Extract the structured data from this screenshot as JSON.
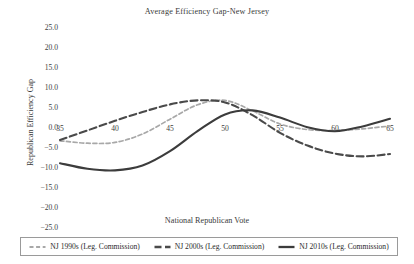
{
  "chart_data": {
    "type": "line",
    "title": "Average Efficiency Gap-New Jersey",
    "xlabel": "National Republican Vote",
    "ylabel": "Republican Efficiency Gap",
    "xlim": [
      35,
      65
    ],
    "ylim": [
      -25.0,
      25.0
    ],
    "grid": false,
    "legend_position": "bottom",
    "xticks": [
      "35",
      "40",
      "45",
      "50",
      "55",
      "60",
      "65"
    ],
    "xtick_values": [
      35,
      40,
      45,
      50,
      55,
      60,
      65
    ],
    "yticks": [
      "25.0",
      "20.0",
      "15.0",
      "10.0",
      "5.0",
      "0.0",
      "-5.0",
      "-10.0",
      "-15.0",
      "-20.0",
      "-25.0"
    ],
    "ytick_values": [
      25.0,
      20.0,
      15.0,
      10.0,
      5.0,
      0.0,
      -5.0,
      -10.0,
      -15.0,
      -20.0,
      -25.0
    ],
    "x": [
      35,
      37.5,
      40,
      42.5,
      45,
      47.5,
      50,
      52.5,
      55,
      57.5,
      60,
      62.5,
      65
    ],
    "series": [
      {
        "name": "NJ 1990s (Leg. Commission)",
        "color": "#a8a8a8",
        "dash": "4,2.6",
        "width": 1.7,
        "values": [
          -3.2,
          -3.8,
          -3.6,
          -1.5,
          2.2,
          5.8,
          6.9,
          4.3,
          1.0,
          -0.4,
          -0.6,
          -0.2,
          0.5
        ]
      },
      {
        "name": "NJ 2000s (Leg. Commission)",
        "color": "#4a4a4a",
        "dash": "7,3.5",
        "width": 2.1,
        "values": [
          -3.0,
          -0.6,
          1.8,
          4.0,
          5.9,
          6.9,
          6.4,
          3.2,
          -1.2,
          -4.4,
          -6.4,
          -7.1,
          -6.5
        ]
      },
      {
        "name": "NJ 2010s (Leg. Commission)",
        "color": "#3c3c3c",
        "dash": "none",
        "width": 2.1,
        "values": [
          -8.8,
          -10.2,
          -10.6,
          -9.4,
          -5.8,
          -0.8,
          3.4,
          4.4,
          2.6,
          0.2,
          -0.8,
          0.4,
          2.3
        ]
      }
    ]
  }
}
